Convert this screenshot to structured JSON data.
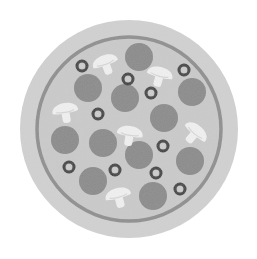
{
  "image": {
    "subject": "pizza-icon",
    "style": "grayscale",
    "colors": {
      "background": "#ffffff",
      "crust": "#d2d2d2",
      "crust_ring": "#8e8e8e",
      "sauce": "#cbcbcb",
      "pepperoni": "#8a8a8a",
      "mushroom": "#f2f2f2",
      "mushroom_shade": "#d8d8d8",
      "olive": "#3a3a3a",
      "olive_hole": "#cfcfcf"
    },
    "pepperoni": [
      {
        "cx": 139,
        "cy": 57,
        "r": 14
      },
      {
        "cx": 88,
        "cy": 88,
        "r": 14
      },
      {
        "cx": 125,
        "cy": 98,
        "r": 14
      },
      {
        "cx": 192,
        "cy": 92,
        "r": 14
      },
      {
        "cx": 164,
        "cy": 118,
        "r": 14
      },
      {
        "cx": 65,
        "cy": 140,
        "r": 14
      },
      {
        "cx": 103,
        "cy": 143,
        "r": 14
      },
      {
        "cx": 139,
        "cy": 155,
        "r": 14
      },
      {
        "cx": 190,
        "cy": 161,
        "r": 14
      },
      {
        "cx": 93,
        "cy": 181,
        "r": 14
      },
      {
        "cx": 153,
        "cy": 196,
        "r": 14
      }
    ],
    "olives": [
      {
        "cx": 82,
        "cy": 66
      },
      {
        "cx": 184,
        "cy": 70
      },
      {
        "cx": 128,
        "cy": 79
      },
      {
        "cx": 151,
        "cy": 93
      },
      {
        "cx": 98,
        "cy": 114
      },
      {
        "cx": 163,
        "cy": 146
      },
      {
        "cx": 69,
        "cy": 167
      },
      {
        "cx": 115,
        "cy": 170
      },
      {
        "cx": 156,
        "cy": 173
      },
      {
        "cx": 180,
        "cy": 189
      }
    ],
    "mushrooms": [
      {
        "x": 105,
        "y": 62,
        "rot": -20
      },
      {
        "x": 160,
        "y": 74,
        "rot": 15
      },
      {
        "x": 65,
        "y": 110,
        "rot": -10
      },
      {
        "x": 130,
        "y": 133,
        "rot": 10
      },
      {
        "x": 196,
        "y": 132,
        "rot": 40
      },
      {
        "x": 118,
        "y": 195,
        "rot": -15
      }
    ]
  }
}
